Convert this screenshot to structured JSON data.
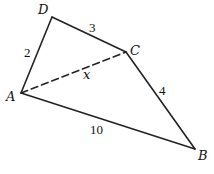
{
  "diagram": {
    "type": "quadrilateral",
    "vertices": {
      "A": {
        "label": "A",
        "x": 21,
        "y": 93
      },
      "B": {
        "label": "B",
        "x": 195,
        "y": 149
      },
      "C": {
        "label": "C",
        "x": 126,
        "y": 52
      },
      "D": {
        "label": "D",
        "x": 52,
        "y": 17
      }
    },
    "edges": [
      {
        "from": "A",
        "to": "D",
        "label": "2",
        "style": "solid"
      },
      {
        "from": "D",
        "to": "C",
        "label": "3",
        "style": "solid"
      },
      {
        "from": "C",
        "to": "B",
        "label": "4",
        "style": "solid"
      },
      {
        "from": "A",
        "to": "B",
        "label": "10",
        "style": "solid"
      },
      {
        "from": "A",
        "to": "C",
        "label": "x",
        "style": "dashed"
      }
    ],
    "stroke_color": "#222222"
  }
}
